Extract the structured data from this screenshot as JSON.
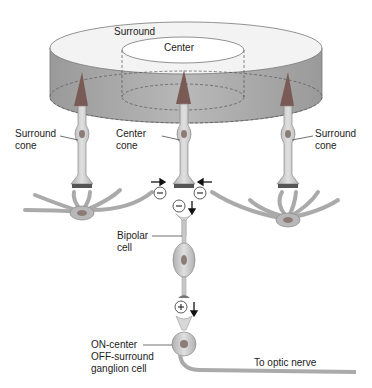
{
  "diagram": {
    "type": "retina receptive field",
    "labels": {
      "surround": "Surround",
      "center": "Center",
      "surround_cone_left": "Surround\ncone",
      "center_cone": "Center\ncone",
      "surround_cone_right": "Surround\ncone",
      "bipolar": "Bipolar\ncell",
      "ganglion": "ON-center\nOFF-surround\nganglion cell",
      "optic": "To optic nerve"
    },
    "signs": {
      "inhibit": "−",
      "excite": "+"
    },
    "colors": {
      "disc_side": "#a8a8a8",
      "disc_top": "#f2f2f2",
      "cone_outer": "#7a5a55",
      "cell_fill": "#c9c9c9",
      "cell_stroke": "#8a8a8a",
      "nucleus": "#8c7c78"
    }
  }
}
